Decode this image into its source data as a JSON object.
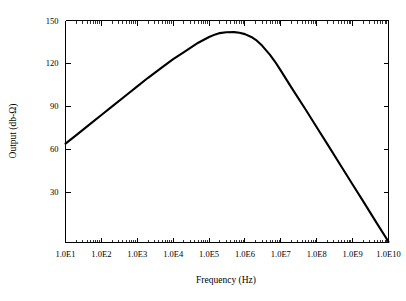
{
  "chart_data": {
    "type": "line",
    "title": "",
    "xlabel": "Frequency (Hz)",
    "ylabel": "Output (db-Ω)",
    "x_scale": "log",
    "y_scale": "linear",
    "grid": false,
    "legend": null,
    "xlim": [
      10,
      10000000000
    ],
    "ylim": [
      -5,
      150
    ],
    "x_tick_labels": [
      "1.0E1",
      "1.0E2",
      "1.0E3",
      "1.0E4",
      "1.0E5",
      "1.0E6",
      "1.0E7",
      "1.0E8",
      "1.0E9",
      "1.0E10"
    ],
    "x_tick_values": [
      10,
      100,
      1000,
      10000,
      100000,
      1000000,
      10000000,
      100000000,
      1000000000,
      10000000000
    ],
    "y_tick_labels": [
      "30",
      "60",
      "90",
      "120",
      "150"
    ],
    "y_tick_values": [
      30,
      60,
      90,
      120,
      150
    ],
    "series": [
      {
        "name": "Output",
        "color": "#000000",
        "x": [
          10,
          20,
          50,
          100,
          200,
          500,
          1000,
          2000,
          5000,
          10000,
          20000,
          50000,
          100000,
          150000,
          200000,
          300000,
          500000,
          700000,
          1000000,
          1500000,
          2000000,
          3000000,
          5000000,
          7000000,
          10000000,
          20000000,
          50000000,
          100000000,
          200000000,
          500000000,
          1000000000,
          2000000000,
          5000000000,
          10000000000
        ],
        "y": [
          64.0,
          70.0,
          78.0,
          84.0,
          90.0,
          98.0,
          104.0,
          110.0,
          117.5,
          123.0,
          128.0,
          134.5,
          138.5,
          140.3,
          141.2,
          141.8,
          141.9,
          141.5,
          140.5,
          138.5,
          136.5,
          132.5,
          126.0,
          121.0,
          115.0,
          103.0,
          87.5,
          75.5,
          63.5,
          47.5,
          35.5,
          23.5,
          7.5,
          -4.5
        ]
      }
    ]
  },
  "axes": {
    "x_title": "Frequency (Hz)",
    "y_title": "Output (db-Ω)"
  }
}
